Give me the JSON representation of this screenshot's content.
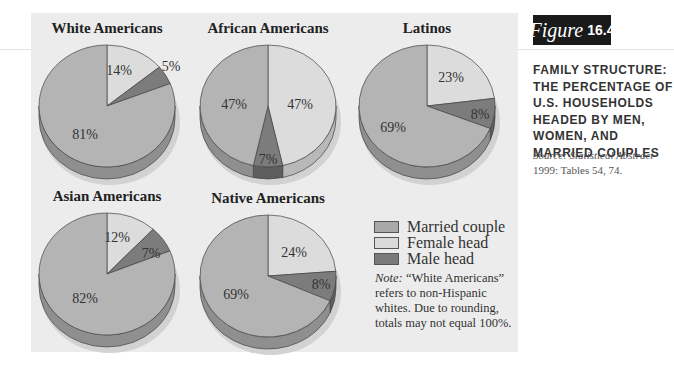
{
  "figure": {
    "label_word": "Figure",
    "label_number": "16.4",
    "title": "FAMILY STRUCTURE: THE PERCENTAGE OF U.S. HOUSEHOLDS HEADED BY MEN, WOMEN, AND MARRIED COUPLES",
    "source_prefix": "Source: Statistical Abstract",
    "source_suffix": " 1999: Tables 54, 74."
  },
  "legend": [
    {
      "label": "Married couple",
      "color": "#a9a9a9"
    },
    {
      "label": "Female head",
      "color": "#dadada"
    },
    {
      "label": "Male head",
      "color": "#7a7a7a"
    }
  ],
  "note": {
    "prefix": "Note:",
    "text": " “White Americans” refers to non-Hispanic whites. Due to rounding, totals may not equal 100%."
  },
  "colors": {
    "married_couple": "#b4b4b4",
    "female_head": "#dcdcdc",
    "male_head": "#7c7c7c",
    "panel_bg": "#ececec",
    "figure_box": "#1a1a1a"
  },
  "chart_data": [
    {
      "type": "pie",
      "title": "White Americans",
      "categories": [
        "Married couple",
        "Female head",
        "Male head"
      ],
      "values": [
        81,
        14,
        5
      ],
      "labels": [
        "81%",
        "14%",
        "5%"
      ]
    },
    {
      "type": "pie",
      "title": "African Americans",
      "categories": [
        "Married couple",
        "Female head",
        "Male head"
      ],
      "values": [
        47,
        47,
        7
      ],
      "labels": [
        "47%",
        "47%",
        "7%"
      ]
    },
    {
      "type": "pie",
      "title": "Latinos",
      "categories": [
        "Married couple",
        "Female head",
        "Male head"
      ],
      "values": [
        69,
        23,
        8
      ],
      "labels": [
        "69%",
        "23%",
        "8%"
      ]
    },
    {
      "type": "pie",
      "title": "Asian Americans",
      "categories": [
        "Married couple",
        "Female head",
        "Male head"
      ],
      "values": [
        82,
        12,
        7
      ],
      "labels": [
        "82%",
        "12%",
        "7%"
      ]
    },
    {
      "type": "pie",
      "title": "Native Americans",
      "categories": [
        "Married couple",
        "Female head",
        "Male head"
      ],
      "values": [
        69,
        24,
        8
      ],
      "labels": [
        "69%",
        "24%",
        "8%"
      ]
    }
  ],
  "pies": [
    {
      "title": "White Americans",
      "cx": 107,
      "cy": 106,
      "label_pos": [
        [
          -22,
          28
        ],
        [
          12,
          -36
        ],
        [
          64,
          -40
        ]
      ]
    },
    {
      "title": "African Americans",
      "cx": 268,
      "cy": 106,
      "label_pos": [
        [
          -34,
          -2
        ],
        [
          32,
          -2
        ],
        [
          0,
          53
        ]
      ]
    },
    {
      "title": "Latinos",
      "cx": 427,
      "cy": 106,
      "label_pos": [
        [
          -34,
          21
        ],
        [
          24,
          -29
        ],
        [
          53,
          8
        ]
      ]
    },
    {
      "title": "Asian Americans",
      "cx": 107,
      "cy": 274,
      "label_pos": [
        [
          -22,
          24
        ],
        [
          10,
          -37
        ],
        [
          44,
          -21
        ]
      ]
    },
    {
      "title": "Native Americans",
      "cx": 268,
      "cy": 276,
      "label_pos": [
        [
          -32,
          18
        ],
        [
          26,
          -24
        ],
        [
          53,
          8
        ]
      ]
    }
  ]
}
